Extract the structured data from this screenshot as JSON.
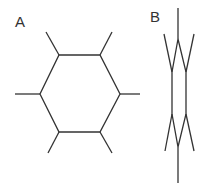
{
  "figure": {
    "panels": [
      {
        "label": "A",
        "description": "planar hexagon with six radial substituent bonds",
        "stroke_color": "#333333",
        "ring_vertices": [
          [
            59,
            55
          ],
          [
            100,
            55
          ],
          [
            120,
            94
          ],
          [
            100,
            132
          ],
          [
            59,
            132
          ],
          [
            40,
            94
          ]
        ],
        "spokes": [
          [
            [
              59,
              55
            ],
            [
              46,
              32
            ]
          ],
          [
            [
              100,
              55
            ],
            [
              112,
              32
            ]
          ],
          [
            [
              120,
              94
            ],
            [
              140,
              94
            ]
          ],
          [
            [
              100,
              132
            ],
            [
              112,
              153
            ]
          ],
          [
            [
              59,
              132
            ],
            [
              48,
              153
            ]
          ],
          [
            [
              40,
              94
            ],
            [
              15,
              94
            ]
          ]
        ]
      },
      {
        "label": "B",
        "description": "edge-on view of hexagonal ring with substituent bonds",
        "stroke_color": "#333333",
        "ring_vertices": [
          [
            178,
            39
          ],
          [
            186,
            72
          ],
          [
            186,
            114
          ],
          [
            178,
            147
          ],
          [
            172,
            114
          ],
          [
            172,
            72
          ]
        ],
        "spokes": [
          [
            [
              178,
              39
            ],
            [
              178,
              8
            ]
          ],
          [
            [
              186,
              72
            ],
            [
              194,
              34
            ]
          ],
          [
            [
              172,
              72
            ],
            [
              164,
              34
            ]
          ],
          [
            [
              186,
              114
            ],
            [
              194,
              151
            ]
          ],
          [
            [
              172,
              114
            ],
            [
              165,
              151
            ]
          ],
          [
            [
              178,
              147
            ],
            [
              178,
              183
            ]
          ]
        ]
      }
    ]
  }
}
